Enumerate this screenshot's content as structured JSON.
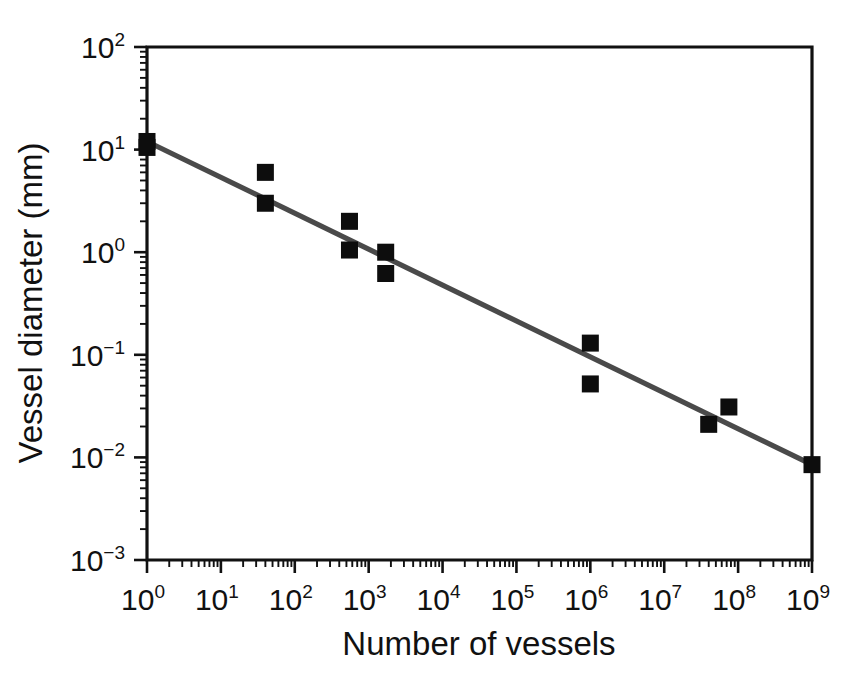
{
  "figure": {
    "background": "#ffffff",
    "frame_color": "#111111",
    "line_color": "#4a4a4a",
    "marker_color": "#0d0d0d"
  },
  "chart_data": {
    "type": "scatter",
    "title": "",
    "xlabel": "Number of vessels",
    "ylabel": "Vessel diameter (mm)",
    "xscale": "log",
    "yscale": "log",
    "xlim": [
      1,
      1000000000
    ],
    "ylim": [
      0.001,
      100
    ],
    "grid": false,
    "legend": null,
    "xtick_labels": [
      "10⁰",
      "10¹",
      "10²",
      "10³",
      "10⁴",
      "10⁵",
      "10⁶",
      "10⁷",
      "10⁸",
      "10⁹"
    ],
    "xtick_values": [
      1,
      10,
      100,
      1000,
      10000,
      100000,
      1000000,
      10000000,
      100000000,
      1000000000
    ],
    "ytick_labels": [
      "10²",
      "10¹",
      "10⁰",
      "10⁻¹",
      "10⁻²",
      "10⁻³"
    ],
    "ytick_values": [
      100,
      10,
      1,
      0.1,
      0.01,
      0.001
    ],
    "series": [
      {
        "name": "Vessel measurements",
        "marker": "square",
        "points": [
          {
            "x": 1,
            "y": 12.0
          },
          {
            "x": 1,
            "y": 10.5
          },
          {
            "x": 40,
            "y": 6.0
          },
          {
            "x": 40,
            "y": 3.0
          },
          {
            "x": 550,
            "y": 2.0
          },
          {
            "x": 550,
            "y": 1.05
          },
          {
            "x": 1700,
            "y": 1.0
          },
          {
            "x": 1700,
            "y": 0.62
          },
          {
            "x": 1000000,
            "y": 0.13
          },
          {
            "x": 1000000,
            "y": 0.052
          },
          {
            "x": 40000000,
            "y": 0.021
          },
          {
            "x": 75000000,
            "y": 0.031
          },
          {
            "x": 1000000000,
            "y": 0.0085
          }
        ]
      }
    ],
    "fit_line": {
      "name": "Power-law fit",
      "x_start": 1,
      "y_start": 12.0,
      "x_end": 1000000000,
      "y_end": 0.0085
    }
  },
  "x_axis_title": "Number of vessels",
  "y_axis_title": "Vessel diameter (mm)",
  "tick_labels": {
    "x": [
      {
        "base": "10",
        "exp": "0"
      },
      {
        "base": "10",
        "exp": "1"
      },
      {
        "base": "10",
        "exp": "2"
      },
      {
        "base": "10",
        "exp": "3"
      },
      {
        "base": "10",
        "exp": "4"
      },
      {
        "base": "10",
        "exp": "5"
      },
      {
        "base": "10",
        "exp": "6"
      },
      {
        "base": "10",
        "exp": "7"
      },
      {
        "base": "10",
        "exp": "8"
      },
      {
        "base": "10",
        "exp": "9"
      }
    ],
    "y": [
      {
        "base": "10",
        "exp": "2"
      },
      {
        "base": "10",
        "exp": "1"
      },
      {
        "base": "10",
        "exp": "0"
      },
      {
        "base": "10",
        "exp": "−1"
      },
      {
        "base": "10",
        "exp": "−2"
      },
      {
        "base": "10",
        "exp": "−3"
      }
    ]
  }
}
